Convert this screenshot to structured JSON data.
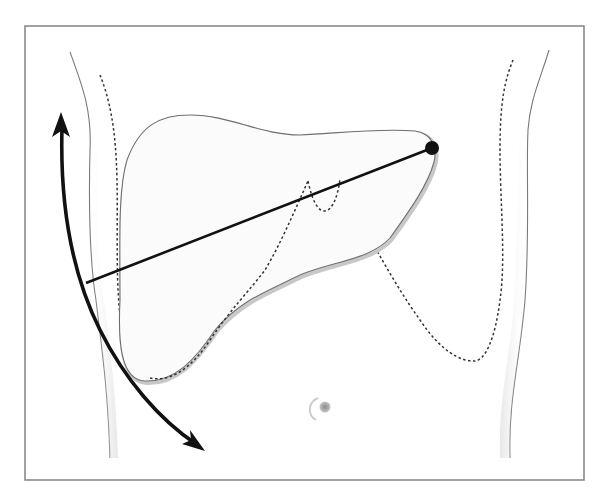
{
  "figure": {
    "frame": {
      "x": 25,
      "y": 26,
      "width": 559,
      "height": 454,
      "stroke": "#8a8a8a"
    },
    "colors": {
      "outline": "#6e6e6e",
      "liver_fill": "#fbfbfb",
      "shadow": "#cfcfcf",
      "dotted": "#333333",
      "measure_line": "#111111",
      "arrow": "#111111",
      "navel": "#9a9a9a"
    },
    "measure_line": {
      "x1": 86,
      "y1": 283,
      "x2": 432,
      "y2": 148
    },
    "endpoint_dot": {
      "cx": 432,
      "cy": 148,
      "r": 7
    }
  }
}
